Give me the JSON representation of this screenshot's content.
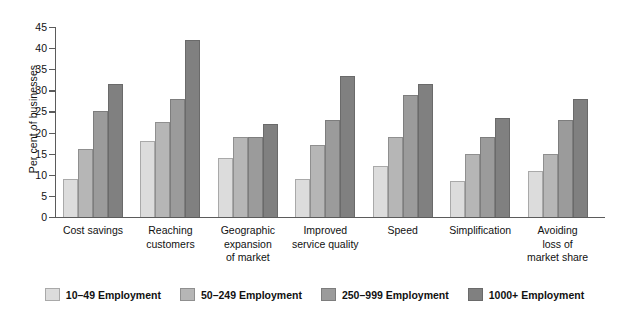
{
  "chart_data": {
    "type": "bar",
    "title": "",
    "xlabel": "",
    "ylabel": "Per cent of businesses",
    "ylim": [
      0,
      45
    ],
    "ytick_step": 5,
    "yticks": [
      0,
      5,
      10,
      15,
      20,
      25,
      30,
      35,
      40,
      45
    ],
    "grid": false,
    "legend_position": "bottom",
    "categories": [
      "Cost savings",
      "Reaching customers",
      "Geographic expansion of market",
      "Improved service quality",
      "Speed",
      "Simplification",
      "Avoiding loss of market share"
    ],
    "category_lines": [
      [
        "Cost savings"
      ],
      [
        "Reaching",
        "customers"
      ],
      [
        "Geographic",
        "expansion",
        "of market"
      ],
      [
        "Improved",
        "service quality"
      ],
      [
        "Speed"
      ],
      [
        "Simplification"
      ],
      [
        "Avoiding",
        "loss of",
        "market share"
      ]
    ],
    "series": [
      {
        "name": "10–49 Employment",
        "color": "#dcdcdc",
        "values": [
          9,
          18,
          14,
          9,
          12,
          8.5,
          11
        ]
      },
      {
        "name": "50–249 Employment",
        "color": "#b6b6b6",
        "values": [
          16,
          22.5,
          19,
          17,
          19,
          15,
          15
        ]
      },
      {
        "name": "250–999 Employment",
        "color": "#9b9b9b",
        "values": [
          25,
          28,
          19,
          23,
          29,
          19,
          23
        ]
      },
      {
        "name": "1000+ Employment",
        "color": "#808080",
        "values": [
          31.5,
          42,
          22,
          33.5,
          31.5,
          23.5,
          28
        ]
      }
    ]
  },
  "legend": {
    "items": [
      {
        "label": "10–49 Employment"
      },
      {
        "label": "50–249 Employment"
      },
      {
        "label": "250–999 Employment"
      },
      {
        "label": "1000+ Employment"
      }
    ]
  }
}
